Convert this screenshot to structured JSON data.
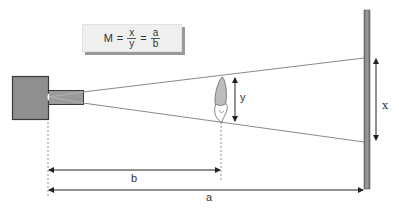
{
  "diagram": {
    "formula": {
      "lhs": "M",
      "eq1": "=",
      "frac1": {
        "numerator": "x",
        "denominator": "y"
      },
      "eq2": "=",
      "frac2": {
        "numerator": "a",
        "denominator": "b"
      }
    },
    "labels": {
      "image_size": "x",
      "object_size": "y",
      "source_to_object": "b",
      "source_to_image": "a"
    },
    "components": {
      "source": "x-ray tube head",
      "object": "tooth",
      "receptor": "image receptor / film"
    },
    "colors": {
      "source_fill": "#8f8f8f",
      "source_border": "#3a3a3a",
      "beam": "#8a8a8a",
      "receptor": "#7d7d7d",
      "arrow": "#222222",
      "formula_bg": "#efefef",
      "formula_shadow": "#9a9a9a"
    }
  }
}
